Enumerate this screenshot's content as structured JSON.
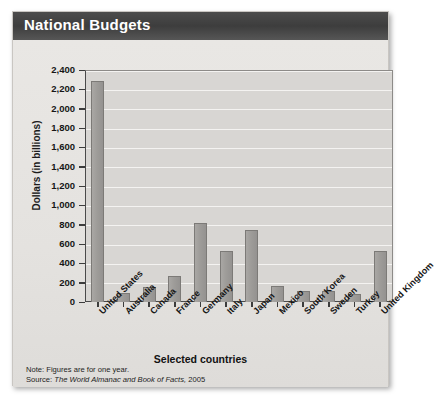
{
  "title": "National Budgets",
  "axis": {
    "ylabel": "Dollars (in billions)",
    "xlabel": "Selected countries",
    "yticks": [
      "2,400",
      "2,200",
      "2,000",
      "1,800",
      "1,600",
      "1,400",
      "1,200",
      "1,000",
      "800",
      "600",
      "400",
      "200",
      "0"
    ]
  },
  "notes": {
    "note_label": "Note: Figures are for one year.",
    "source_label": "Source:",
    "source_title": "The World Almanac and Book of Facts,",
    "source_year": "2005"
  },
  "colors": {
    "title_bar": "#3d3d3d",
    "bar_fill": "#9e9c99",
    "bar_stroke": "#7c7a77",
    "plot_bg": "#d8d6d3",
    "gridline": "#f4f3f1",
    "card_bg": "#eceae7"
  },
  "chart_data": {
    "type": "bar",
    "title": "National Budgets",
    "xlabel": "Selected countries",
    "ylabel": "Dollars (in billions)",
    "ylim": [
      0,
      2400
    ],
    "ytick_step": 200,
    "grid": true,
    "legend": "none",
    "categories": [
      "United States",
      "Australia",
      "Canada",
      "France",
      "Germany",
      "Italy",
      "Japan",
      "Mexico",
      "South Korea",
      "Sweden",
      "Turkey",
      "United Kingdom"
    ],
    "values": [
      2290,
      90,
      160,
      270,
      820,
      530,
      750,
      170,
      110,
      110,
      80,
      530
    ],
    "units": "billions of dollars",
    "note": "Note: Figures are for one year.",
    "source": "The World Almanac and Book of Facts, 2005"
  }
}
